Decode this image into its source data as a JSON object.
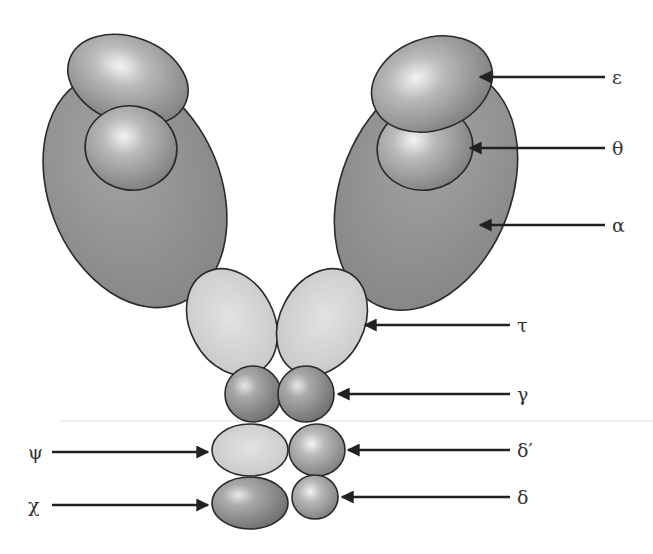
{
  "diagram": {
    "title": "",
    "subunits": [
      {
        "id": "alpha",
        "label": "α",
        "count": 2,
        "shade": "dark"
      },
      {
        "id": "epsilon",
        "label": "ε",
        "count": 2,
        "shade": "medium"
      },
      {
        "id": "theta",
        "label": "θ",
        "count": 2,
        "shade": "medium"
      },
      {
        "id": "tau",
        "label": "τ",
        "count": 2,
        "shade": "light"
      },
      {
        "id": "gamma",
        "label": "γ",
        "count": 2,
        "shade": "medium"
      },
      {
        "id": "delta_prime",
        "label": "δ′",
        "count": 1,
        "shade": "medium"
      },
      {
        "id": "delta",
        "label": "δ",
        "count": 1,
        "shade": "medium"
      },
      {
        "id": "psi",
        "label": "ψ",
        "count": 1,
        "shade": "light"
      },
      {
        "id": "chi",
        "label": "χ",
        "count": 1,
        "shade": "medium"
      }
    ],
    "labels": {
      "epsilon": "ε",
      "theta": "θ",
      "alpha": "α",
      "tau": "τ",
      "gamma": "γ",
      "delta_prime": "δ′",
      "delta": "δ",
      "psi": "ψ",
      "chi": "χ"
    },
    "colors": {
      "dark": "#8a8a8a",
      "medium": "#9a9a9a",
      "light": "#cfcfcf",
      "highlight": "#f2f2f2",
      "outline": "#2a2a2a",
      "arrow": "#222222"
    }
  }
}
